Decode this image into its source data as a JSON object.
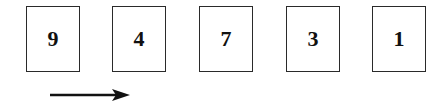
{
  "cards": [
    {
      "value": "9",
      "x": 26
    },
    {
      "value": "4",
      "x": 112
    },
    {
      "value": "7",
      "x": 199
    },
    {
      "value": "3",
      "x": 286
    },
    {
      "value": "1",
      "x": 372
    }
  ],
  "arrow": {
    "direction": "right",
    "icon": "right-arrow-icon"
  }
}
